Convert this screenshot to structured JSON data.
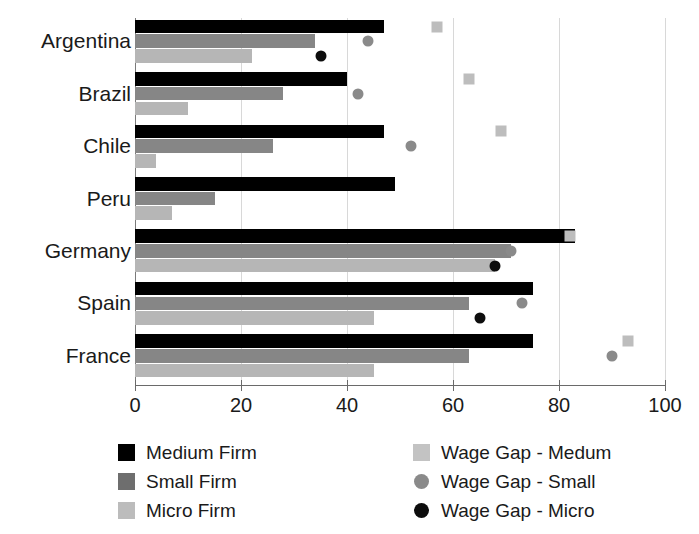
{
  "chart_data": {
    "type": "bar",
    "orientation": "horizontal",
    "title": "",
    "xlabel": "",
    "ylabel": "",
    "xlim": [
      0,
      100
    ],
    "xticks": [
      0,
      20,
      40,
      60,
      80,
      100
    ],
    "xtick_labels": [
      "0",
      "20",
      "40",
      "60",
      "80",
      "100"
    ],
    "grid": true,
    "grid_axis": "x",
    "legend_position": "below",
    "categories": [
      "Argentina",
      "Brazil",
      "Chile",
      "Peru",
      "Germany",
      "Spain",
      "France"
    ],
    "series": [
      {
        "name": "Medium Firm",
        "kind": "bar",
        "color": "#000000",
        "values": [
          47,
          40,
          47,
          49,
          83,
          75,
          75
        ]
      },
      {
        "name": "Small Firm",
        "kind": "bar",
        "color": "#868686",
        "values": [
          34,
          28,
          26,
          15,
          71,
          63,
          63
        ]
      },
      {
        "name": "Micro Firm",
        "kind": "bar",
        "color": "#b6b6b6",
        "values": [
          22,
          10,
          4,
          7,
          68,
          45,
          45
        ]
      },
      {
        "name": "Wage Gap - Medum",
        "kind": "marker",
        "marker": "square",
        "color": "#bdbdbd",
        "values": [
          57,
          63,
          69,
          null,
          82,
          null,
          93
        ]
      },
      {
        "name": "Wage Gap - Small",
        "kind": "marker",
        "marker": "circle",
        "color": "#8a8a8a",
        "values": [
          44,
          42,
          52,
          null,
          71,
          73,
          90
        ]
      },
      {
        "name": "Wage Gap - Micro",
        "kind": "marker",
        "marker": "circle",
        "color": "#0d0d0d",
        "values": [
          35,
          null,
          null,
          null,
          68,
          65,
          null
        ]
      }
    ]
  },
  "axis": {
    "x_tick_labels": [
      "0",
      "20",
      "40",
      "60",
      "80",
      "100"
    ]
  },
  "categories": {
    "items": [
      "Argentina",
      "Brazil",
      "Chile",
      "Peru",
      "Germany",
      "Spain",
      "France"
    ]
  },
  "legend": {
    "left": [
      {
        "label": "Medium Firm",
        "swatch": "legend-swatch-medium-firm"
      },
      {
        "label": "Small Firm",
        "swatch": "legend-swatch-small-firm"
      },
      {
        "label": "Micro Firm",
        "swatch": "legend-swatch-micro-firm"
      }
    ],
    "right": [
      {
        "label": "Wage Gap - Medum",
        "swatch": "legend-swatch-wage-gap-medium"
      },
      {
        "label": "Wage Gap - Small",
        "swatch": "legend-swatch-wage-gap-small"
      },
      {
        "label": "Wage Gap - Micro",
        "swatch": "legend-swatch-wage-gap-micro"
      }
    ]
  },
  "colors": {
    "medium_firm": "#000000",
    "small_firm": "#868686",
    "micro_firm": "#b6b6b6",
    "wage_gap_medium": "#bdbdbd",
    "wage_gap_small": "#8a8a8a",
    "wage_gap_micro": "#0d0d0d",
    "gridline": "#d8d8d8",
    "axis": "#6a6a6a"
  }
}
